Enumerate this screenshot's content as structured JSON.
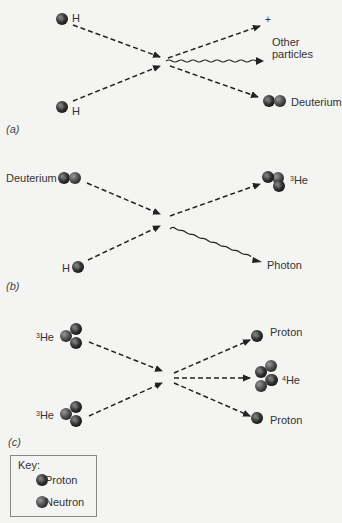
{
  "panels": {
    "a": {
      "label": "(a)",
      "inputs": [
        "H",
        "H"
      ],
      "outputs": {
        "plus": "+",
        "other": "Other particles",
        "other_line1": "Other",
        "other_line2": "particles",
        "deuterium": "Deuterium"
      }
    },
    "b": {
      "label": "(b)",
      "inputs": [
        "Deuterium",
        "H"
      ],
      "outputs": {
        "he3_sup": "3",
        "he3_base": "He",
        "photon": "Photon"
      }
    },
    "c": {
      "label": "(c)",
      "inputs": [
        {
          "sup": "3",
          "base": "He"
        },
        {
          "sup": "3",
          "base": "He"
        }
      ],
      "outputs": {
        "proton_top": "Proton",
        "he4_sup": "4",
        "he4_base": "He",
        "proton_bottom": "Proton"
      }
    }
  },
  "key": {
    "title": "Key:",
    "items": [
      {
        "label": "Proton",
        "icon": "proton-sphere-icon"
      },
      {
        "label": "Neutron",
        "icon": "neutron-sphere-icon"
      }
    ]
  },
  "colors": {
    "background": "#f4f4f2",
    "proton": "#3a3a3a",
    "neutron": "#5a5a5a",
    "arrow": "#222222",
    "text": "#333333"
  }
}
